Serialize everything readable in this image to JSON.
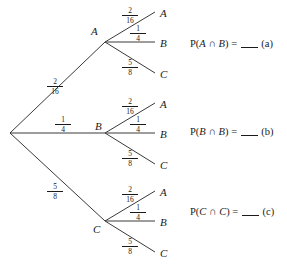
{
  "diagram": {
    "type": "probability-tree",
    "root": {
      "x": 10,
      "y": 133
    },
    "level1": [
      {
        "id": "a",
        "label": "A",
        "fraction": {
          "numerator": "2",
          "denominator": "16"
        },
        "node": {
          "x": 105,
          "y": 42
        },
        "label_pos": {
          "x": 91,
          "y": 26
        },
        "frac_pos": {
          "x": 47,
          "y": 78
        },
        "children": [
          {
            "label": "A",
            "fraction": {
              "numerator": "2",
              "denominator": "16"
            },
            "leaf": {
              "x": 155,
              "y": 12
            },
            "label_pos": {
              "x": 160,
              "y": 8
            },
            "frac_pos": {
              "x": 122,
              "y": 7
            }
          },
          {
            "label": "B",
            "fraction": {
              "numerator": "1",
              "denominator": "4"
            },
            "leaf": {
              "x": 155,
              "y": 42
            },
            "label_pos": {
              "x": 160,
              "y": 38
            },
            "frac_pos": {
              "x": 130,
              "y": 25
            }
          },
          {
            "label": "C",
            "fraction": {
              "numerator": "5",
              "denominator": "8"
            },
            "leaf": {
              "x": 155,
              "y": 73
            },
            "label_pos": {
              "x": 160,
              "y": 69
            },
            "frac_pos": {
              "x": 122,
              "y": 59
            }
          }
        ],
        "equation": {
          "prefix": "P(",
          "left": "A",
          "operator": " ∩ ",
          "right": "B",
          "middle": ") = ",
          "suffix": "(a)",
          "pos": {
            "x": 190,
            "y": 38
          }
        }
      },
      {
        "id": "b",
        "label": "B",
        "fraction": {
          "numerator": "1",
          "denominator": "4"
        },
        "node": {
          "x": 105,
          "y": 133
        },
        "label_pos": {
          "x": 95,
          "y": 121
        },
        "frac_pos": {
          "x": 55,
          "y": 116
        },
        "children": [
          {
            "label": "A",
            "fraction": {
              "numerator": "2",
              "denominator": "16"
            },
            "leaf": {
              "x": 155,
              "y": 103
            },
            "label_pos": {
              "x": 160,
              "y": 99
            },
            "frac_pos": {
              "x": 122,
              "y": 98
            }
          },
          {
            "label": "B",
            "fraction": {
              "numerator": "1",
              "denominator": "4"
            },
            "leaf": {
              "x": 155,
              "y": 133
            },
            "label_pos": {
              "x": 160,
              "y": 129
            },
            "frac_pos": {
              "x": 130,
              "y": 116
            }
          },
          {
            "label": "C",
            "fraction": {
              "numerator": "5",
              "denominator": "8"
            },
            "leaf": {
              "x": 155,
              "y": 164
            },
            "label_pos": {
              "x": 160,
              "y": 160
            },
            "frac_pos": {
              "x": 122,
              "y": 150
            }
          }
        ],
        "equation": {
          "prefix": "P(",
          "left": "B",
          "operator": " ∩ ",
          "right": "B",
          "middle": ") = ",
          "suffix": "(b)",
          "pos": {
            "x": 190,
            "y": 126
          }
        }
      },
      {
        "id": "c",
        "label": "C",
        "fraction": {
          "numerator": "5",
          "denominator": "8"
        },
        "node": {
          "x": 105,
          "y": 221
        },
        "label_pos": {
          "x": 93,
          "y": 224
        },
        "frac_pos": {
          "x": 47,
          "y": 183
        },
        "children": [
          {
            "label": "A",
            "fraction": {
              "numerator": "2",
              "denominator": "16"
            },
            "leaf": {
              "x": 155,
              "y": 191
            },
            "label_pos": {
              "x": 160,
              "y": 187
            },
            "frac_pos": {
              "x": 122,
              "y": 186
            }
          },
          {
            "label": "B",
            "fraction": {
              "numerator": "1",
              "denominator": "4"
            },
            "leaf": {
              "x": 155,
              "y": 221
            },
            "label_pos": {
              "x": 160,
              "y": 217
            },
            "frac_pos": {
              "x": 130,
              "y": 204
            }
          },
          {
            "label": "C",
            "fraction": {
              "numerator": "5",
              "denominator": "8"
            },
            "leaf": {
              "x": 155,
              "y": 252
            },
            "label_pos": {
              "x": 160,
              "y": 248
            },
            "frac_pos": {
              "x": 122,
              "y": 238
            }
          }
        ],
        "equation": {
          "prefix": "P(",
          "left": "C",
          "operator": " ∩ ",
          "right": "C",
          "middle": ") = ",
          "suffix": "(c)",
          "pos": {
            "x": 190,
            "y": 206
          }
        }
      }
    ],
    "style": {
      "line_color": "#3a3a3a",
      "text_color": "#1a1a1a",
      "background": "#ffffff"
    }
  }
}
